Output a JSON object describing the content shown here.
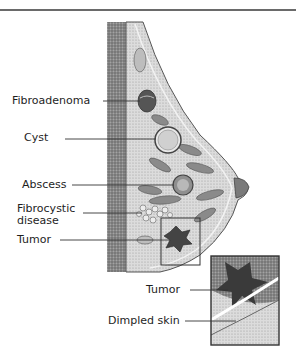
{
  "header": {
    "partial_title": "..."
  },
  "diagram": {
    "labels": [
      {
        "id": "fibroadenoma",
        "text": "Fibroadenoma"
      },
      {
        "id": "cyst",
        "text": "Cyst"
      },
      {
        "id": "abscess",
        "text": "Abscess"
      },
      {
        "id": "fibrocystic",
        "text": "Fibrocystic disease",
        "line1": "Fibrocystic",
        "line2": "disease"
      },
      {
        "id": "tumor",
        "text": "Tumor"
      }
    ],
    "inset": {
      "labels": [
        {
          "id": "inset-tumor",
          "text": "Tumor"
        },
        {
          "id": "dimpled-skin",
          "text": "Dimpled skin"
        }
      ]
    },
    "colors": {
      "chest_wall": "#7a7a7a",
      "tissue": "#d4d4d4",
      "lobule": "#8a8a8a",
      "outline": "#555555",
      "leader_line": "#333333"
    }
  }
}
